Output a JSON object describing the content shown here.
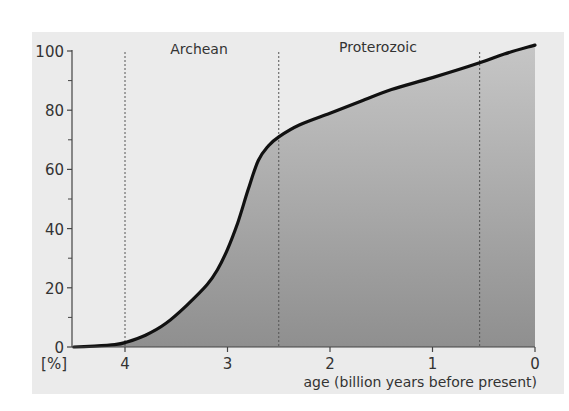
{
  "chart_data": {
    "type": "area",
    "title": "",
    "xlabel": "age (billion years before present)",
    "ylabel": "[%]",
    "xlim": [
      4.5,
      0
    ],
    "ylim": [
      0,
      100
    ],
    "x_ticks": [
      4,
      3,
      2,
      1,
      0
    ],
    "x_tick_labels": [
      "4",
      "3",
      "2",
      "1",
      "0"
    ],
    "y_ticks": [
      0,
      20,
      40,
      60,
      80,
      100
    ],
    "y_tick_labels": [
      "0",
      "20",
      "40",
      "60",
      "80",
      "100"
    ],
    "y_minor_ticks": [
      10,
      30,
      50,
      70,
      90
    ],
    "grid": false,
    "legend": null,
    "eras": [
      {
        "label": "Archean",
        "start": 4.0,
        "end": 2.5
      },
      {
        "label": "Proterozoic",
        "start": 2.5,
        "end": 0.54
      }
    ],
    "boundaries": [
      4.0,
      2.5,
      0.54
    ],
    "series": [
      {
        "name": "curve",
        "x": [
          4.5,
          4.3,
          4.1,
          4.0,
          3.8,
          3.6,
          3.4,
          3.2,
          3.1,
          3.0,
          2.9,
          2.8,
          2.7,
          2.6,
          2.5,
          2.3,
          2.0,
          1.7,
          1.4,
          1.0,
          0.54,
          0.3,
          0.0
        ],
        "y": [
          0,
          0.3,
          0.8,
          1.5,
          4,
          8,
          14,
          21,
          26,
          33,
          42,
          53,
          63,
          68,
          71,
          75,
          79,
          83,
          87,
          91,
          96,
          99,
          102
        ]
      }
    ]
  },
  "labels": {
    "era_archean": "Archean",
    "era_proterozoic": "Proterozoic",
    "y_unit": "[%]",
    "x_axis_title": "age (billion years before present)"
  },
  "colors": {
    "panel_bg": "#ebebeb",
    "fill_top": "#c6c6c6",
    "fill_bottom": "#8f8f8f",
    "curve": "#111111",
    "axis": "#444444"
  }
}
